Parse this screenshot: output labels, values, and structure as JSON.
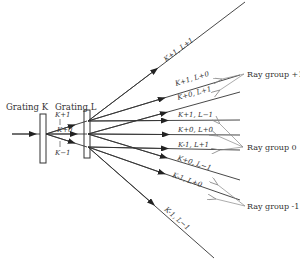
{
  "diagram": {
    "grating_k_label": "Grating K",
    "grating_l_label": "Grating L",
    "k_orders": {
      "plus": "K+1",
      "zero": "K+0",
      "minus": "K−1"
    },
    "rays": [
      {
        "label": "K+1, L+1",
        "group": "+1"
      },
      {
        "label": "K+1, L+0",
        "group": "+1"
      },
      {
        "label": "K+0, L+1",
        "group": "+1"
      },
      {
        "label": "K+1, L−1",
        "group": "0"
      },
      {
        "label": "K+0, L+0",
        "group": "0"
      },
      {
        "label": "K-1, L+1",
        "group": "0"
      },
      {
        "label": "K+0, L−1",
        "group": "-1"
      },
      {
        "label": "K-1, L+0",
        "group": "-1"
      },
      {
        "label": "K-1, L−1",
        "group": "-2"
      }
    ],
    "groups": {
      "plus1": "Ray group +1",
      "zero": "Ray group 0",
      "minus1": "Ray group -1"
    },
    "colors": {
      "line": "#333333",
      "pointer": "#888888",
      "background": "#ffffff"
    }
  }
}
